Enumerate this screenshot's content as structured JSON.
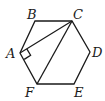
{
  "diagram": {
    "type": "geometry",
    "vertices": [
      {
        "name": "A",
        "label": "A"
      },
      {
        "name": "B",
        "label": "B"
      },
      {
        "name": "C",
        "label": "C"
      },
      {
        "name": "D",
        "label": "D"
      },
      {
        "name": "E",
        "label": "E"
      },
      {
        "name": "F",
        "label": "F"
      }
    ],
    "segments": [
      "AB",
      "BC",
      "CD",
      "DE",
      "EF",
      "FA",
      "CA",
      "CF"
    ],
    "right_angle_at": "A"
  }
}
